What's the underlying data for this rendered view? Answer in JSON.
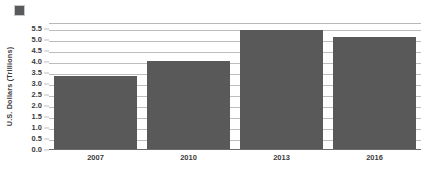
{
  "chart_data": {
    "type": "bar",
    "title": "",
    "subtitle": "",
    "xlabel": "",
    "ylabel": "U.S. Dollars (Trillions)",
    "categories": [
      "2007",
      "2010",
      "2013",
      "2016"
    ],
    "values": [
      3.3,
      4.0,
      5.37,
      5.07
    ],
    "series": [
      {
        "name": "",
        "color": "#59595a",
        "values": [
          3.3,
          4.0,
          5.37,
          5.07
        ]
      }
    ],
    "ylim": [
      0.0,
      5.75
    ],
    "ytick_values": [
      0.0,
      0.5,
      1.0,
      1.5,
      2.0,
      2.5,
      3.0,
      3.5,
      4.0,
      4.5,
      5.0,
      5.5
    ],
    "ytick_labels": [
      "0.0",
      "0.5",
      "1.0",
      "1.5",
      "2.0",
      "2.5",
      "3.0",
      "3.5",
      "4.0",
      "4.5",
      "5.0",
      "5.5"
    ],
    "grid": true,
    "grid_axis": "y",
    "legend": {
      "position": "top-left",
      "entries": [
        {
          "label": "",
          "color": "#59595a"
        }
      ]
    },
    "colors": {
      "bar": "#59595a",
      "gridline": "#bdbdbd",
      "axis": "#6b6b6b",
      "text": "#3b3b3b",
      "background": "#ffffff"
    }
  }
}
